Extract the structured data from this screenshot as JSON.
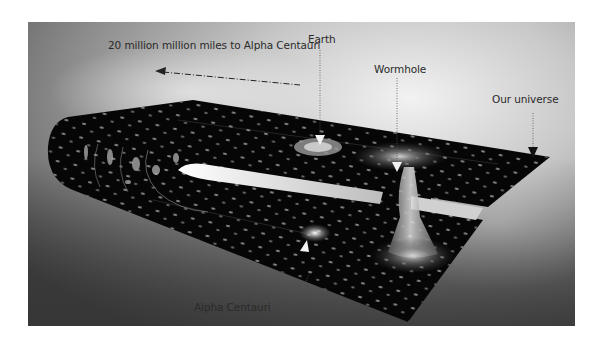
{
  "diagram": {
    "labels": {
      "distance": "20 million million miles to Alpha Centauri",
      "earth": "Earth",
      "wormhole": "Wormhole",
      "our_universe": "Our universe",
      "alpha_centauri": "Alpha Centauri"
    },
    "icons": {
      "distance_arrow": "dash-dot-arrow-left",
      "earth_marker": "triangle-down-pointer",
      "wormhole_marker": "triangle-down-pointer",
      "universe_marker": "triangle-down-pointer",
      "alpha_marker": "triangle-up-pointer"
    },
    "colors": {
      "sky_light": "#e8e8e8",
      "sky_dark": "#5a5a5a",
      "space_sheet": "#050505",
      "star_dots": "#9a9a9a",
      "label_text": "#2a2a2a"
    }
  }
}
